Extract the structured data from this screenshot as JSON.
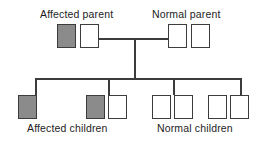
{
  "diagram": {
    "background_color": "#ffffff",
    "line_color": "#3c3c3c",
    "shaded_fill": "#8b8b8b",
    "open_fill": "#ffffff",
    "text_color": "#1d1d1d"
  },
  "labels": {
    "affected_parent": "Affected parent",
    "normal_parent": "Normal parent",
    "affected_children": "Affected children",
    "normal_children": "Normal children"
  },
  "generations": [
    {
      "name": "parents",
      "individuals": [
        {
          "id": "p1",
          "shape": "square",
          "status": "affected",
          "x": 57,
          "y": 24,
          "w": 19,
          "h": 24
        },
        {
          "id": "p2",
          "shape": "square",
          "status": "normal",
          "x": 80,
          "y": 24,
          "w": 19,
          "h": 24
        },
        {
          "id": "p3",
          "shape": "square",
          "status": "normal",
          "x": 168,
          "y": 24,
          "w": 19,
          "h": 24
        },
        {
          "id": "p4",
          "shape": "square",
          "status": "normal",
          "x": 191,
          "y": 24,
          "w": 19,
          "h": 24
        }
      ]
    },
    {
      "name": "children",
      "individuals": [
        {
          "id": "c1",
          "shape": "square",
          "status": "affected",
          "x": 18,
          "y": 95,
          "w": 19,
          "h": 24
        },
        {
          "id": "c2",
          "shape": "square",
          "status": "affected",
          "x": 86,
          "y": 95,
          "w": 19,
          "h": 24
        },
        {
          "id": "c3",
          "shape": "square",
          "status": "normal",
          "x": 108,
          "y": 95,
          "w": 19,
          "h": 24
        },
        {
          "id": "c4",
          "shape": "square",
          "status": "normal",
          "x": 152,
          "y": 95,
          "w": 19,
          "h": 24
        },
        {
          "id": "c5",
          "shape": "square",
          "status": "normal",
          "x": 174,
          "y": 95,
          "w": 19,
          "h": 24
        },
        {
          "id": "c6",
          "shape": "square",
          "status": "normal",
          "x": 208,
          "y": 95,
          "w": 19,
          "h": 24
        },
        {
          "id": "c7",
          "shape": "square",
          "status": "normal",
          "x": 230,
          "y": 95,
          "w": 19,
          "h": 24
        }
      ]
    }
  ],
  "connectors": {
    "marriage_line": {
      "x": 99,
      "y": 38,
      "w": 69
    },
    "descent_line": {
      "x": 134,
      "y": 38,
      "h": 41
    },
    "sibship_line": {
      "x": 35,
      "y": 78,
      "w": 206
    },
    "sibling_drops": [
      {
        "x": 35,
        "y": 78,
        "h": 17
      },
      {
        "x": 108,
        "y": 78,
        "h": 17
      },
      {
        "x": 173,
        "y": 78,
        "h": 17
      },
      {
        "x": 240,
        "y": 78,
        "h": 17
      }
    ]
  },
  "label_positions": {
    "affected_parent": {
      "x": 40,
      "y": 8
    },
    "normal_parent": {
      "x": 152,
      "y": 8
    },
    "affected_children": {
      "x": 27,
      "y": 122
    },
    "normal_children": {
      "x": 157,
      "y": 122
    }
  },
  "counts": {
    "affected_parent_symbols": 2,
    "normal_parent_symbols": 2,
    "affected_children_symbols": 3,
    "normal_children_symbols": 4
  }
}
